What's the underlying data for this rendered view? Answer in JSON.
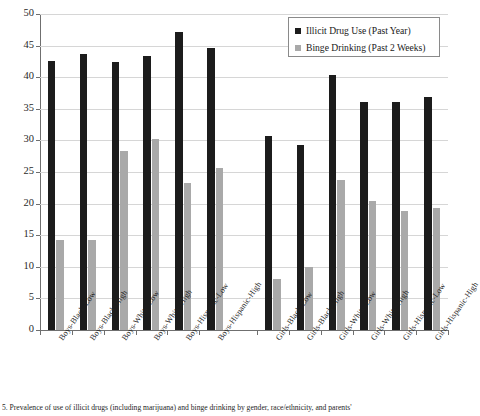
{
  "chart_data": {
    "type": "bar",
    "title": "",
    "xlabel": "",
    "ylabel": "",
    "ylim": [
      0,
      50
    ],
    "yticks": [
      0,
      5,
      10,
      15,
      20,
      25,
      30,
      35,
      40,
      45,
      50
    ],
    "grid": true,
    "legend_position": "top-right",
    "categories": [
      "Boys-Black-Low",
      "Boys-Black-High",
      "Boys-White-Low",
      "Boys-White-High",
      "Boys-Hispanic-Low",
      "Boys-Hispanic-High",
      "Girls-Black-Low",
      "Girls-Black-High",
      "Girls-White-Low",
      "Girls-White-High",
      "Girls-Hispanic-Low",
      "Girls-Hispanic-High"
    ],
    "series": [
      {
        "name": "Illicit Drug Use (Past Year)",
        "color": "#1c1c1c",
        "values": [
          42.6,
          43.6,
          42.4,
          43.4,
          47.2,
          44.6,
          30.7,
          29.3,
          40.3,
          36.0,
          36.0,
          36.8
        ]
      },
      {
        "name": "Binge Drinking (Past 2 Weeks)",
        "color": "#a9a9a9",
        "values": [
          14.3,
          14.2,
          28.4,
          30.3,
          23.2,
          25.7,
          8.0,
          10.0,
          23.8,
          20.4,
          18.8,
          19.3
        ]
      }
    ]
  },
  "legend": {
    "entries": [
      {
        "label": "Illicit Drug Use (Past Year)",
        "swatch": "#1c1c1c",
        "icon": "square-swatch-dark-icon"
      },
      {
        "label": "Binge Drinking (Past 2 Weeks)",
        "swatch": "#a9a9a9",
        "icon": "square-swatch-grey-icon"
      }
    ]
  },
  "caption": {
    "text": "5. Prevalence of use of illicit drugs (including marijuana) and binge drinking by gender, race/ethnicity, and parents'"
  }
}
